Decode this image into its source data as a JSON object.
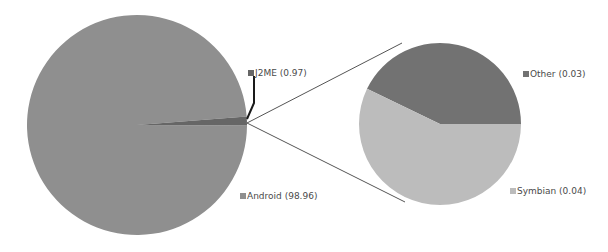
{
  "chart_data": {
    "type": "pie",
    "subtype": "pie-of-pie",
    "title": "",
    "categories": [
      "Android",
      "J2ME",
      "Other",
      "Symbian"
    ],
    "values": [
      98.96,
      0.97,
      0.03,
      0.04
    ],
    "main_pie": {
      "slices": [
        {
          "name": "Android",
          "value": 98.96,
          "color": "#8f8f8f"
        },
        {
          "name": "J2ME",
          "value": 0.97,
          "color": "#666666"
        }
      ],
      "exploded_slice": "J2ME"
    },
    "secondary_pie": {
      "slices": [
        {
          "name": "Other",
          "value": 0.03,
          "color": "#727272"
        },
        {
          "name": "Symbian",
          "value": 0.04,
          "color": "#bcbcbc"
        }
      ]
    },
    "legend_position": "data-labels",
    "grid": false
  },
  "labels": {
    "j2me": "J2ME (0.97)",
    "android": "Android (98.96)",
    "other": "Other (0.03)",
    "symbian": "Symbian (0.04)"
  },
  "colors": {
    "android": "#8f8f8f",
    "j2me": "#666666",
    "other": "#727272",
    "symbian": "#bcbcbc",
    "connector": "#555555",
    "leader": "#1a1a1a"
  }
}
